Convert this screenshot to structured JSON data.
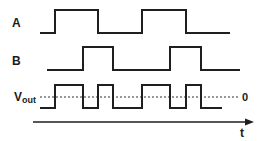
{
  "diagram": {
    "type": "timing-diagram",
    "signals": [
      {
        "name": "A",
        "label": "A",
        "levels": "0,1,0,1,0",
        "points": "40,33 55,33 55,10 98,10 98,33 142,33 142,10 186,10 186,33 230,33"
      },
      {
        "name": "B",
        "label": "B",
        "levels": "0,1,0,1,0",
        "points": "47,70 83,70 83,47 113,47 113,70 170,70 170,47 201,47 201,70 240,70"
      },
      {
        "name": "Vout",
        "label_main": "V",
        "label_sub": "out",
        "levels": "-,+,-,+,-,+,-,+,-",
        "points": "40,108 55,108 55,85 83,85 83,108 98,108 98,85 113,85 113,108 142,108 142,85 170,85 170,108 186,108 186,85 201,85 201,108 222,108"
      }
    ],
    "zero_line": {
      "label": "0",
      "y": 97
    },
    "time_axis": {
      "label": "t"
    }
  },
  "colors": {
    "waveform": "#1f1f1f",
    "zero_line": "#777777",
    "background": "#ffffff"
  }
}
